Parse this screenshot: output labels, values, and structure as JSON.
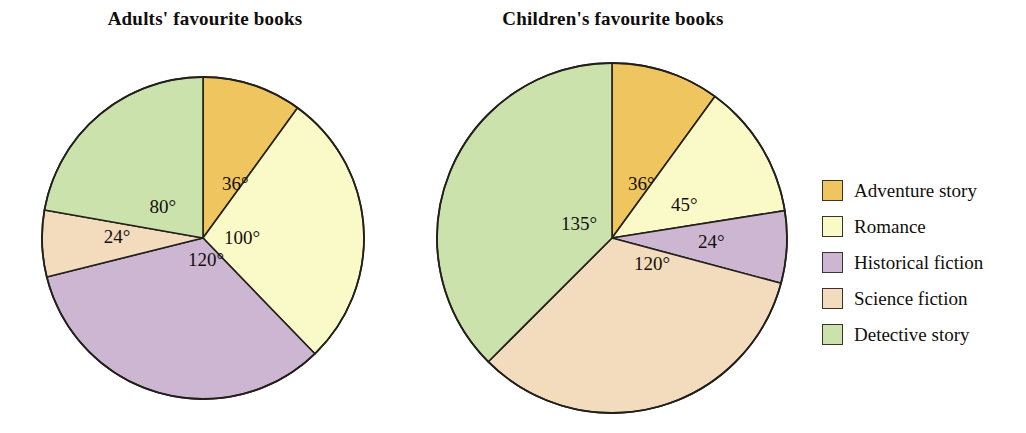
{
  "legend": {
    "position": "right",
    "items": [
      {
        "label": "Adventure story",
        "color": "#EFC55F"
      },
      {
        "label": "Romance",
        "color": "#FAFAC8"
      },
      {
        "label": "Historical fiction",
        "color": "#CDB6D1"
      },
      {
        "label": "Science fiction",
        "color": "#F3DCBE"
      },
      {
        "label": "Detective story",
        "color": "#CBE2AD"
      }
    ]
  },
  "chart_data": [
    {
      "type": "pie",
      "title": "Adults' favourite books",
      "unit": "degrees",
      "center": [
        203,
        238
      ],
      "radius": 161,
      "start_angle": 0,
      "direction": "clockwise",
      "categories": [
        "Adventure story",
        "Romance",
        "Historical fiction",
        "Science fiction",
        "Detective story"
      ],
      "values": [
        36,
        100,
        120,
        24,
        80
      ],
      "colors": [
        "#EFC55F",
        "#FAFAC8",
        "#CDB6D1",
        "#F3DCBE",
        "#CBE2AD"
      ],
      "labels": [
        "36°",
        "100°",
        "120°",
        "24°",
        "80°"
      ],
      "label_positions": [
        [
          222,
          190
        ],
        [
          224,
          244
        ],
        [
          188,
          266
        ],
        [
          117,
          243
        ],
        [
          176,
          213
        ]
      ],
      "label_anchors": [
        "start",
        "start",
        "start",
        "middle",
        "end"
      ]
    },
    {
      "type": "pie",
      "title": "Children's favourite books",
      "unit": "degrees",
      "center": [
        612,
        238
      ],
      "radius": 175,
      "start_angle": 0,
      "direction": "clockwise",
      "categories": [
        "Adventure story",
        "Romance",
        "Historical fiction",
        "Science fiction",
        "Detective story"
      ],
      "values": [
        36,
        45,
        24,
        120,
        135
      ],
      "colors": [
        "#EFC55F",
        "#FAFAC8",
        "#CDB6D1",
        "#F3DCBE",
        "#CBE2AD"
      ],
      "labels": [
        "36°",
        "45°",
        "24°",
        "120°",
        "135°"
      ],
      "label_positions": [
        [
          628,
          190
        ],
        [
          671,
          211
        ],
        [
          698,
          248
        ],
        [
          634,
          270
        ],
        [
          597,
          230
        ]
      ],
      "label_anchors": [
        "start",
        "start",
        "start",
        "start",
        "end"
      ]
    }
  ]
}
